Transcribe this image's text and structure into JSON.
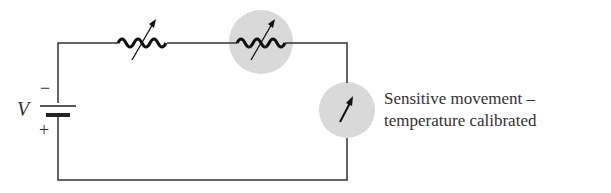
{
  "diagram": {
    "battery": {
      "label": "V",
      "negative": "−",
      "positive": "+"
    },
    "components": [
      {
        "type": "variable-resistor",
        "highlighted": false
      },
      {
        "type": "variable-resistor",
        "highlighted": true
      },
      {
        "type": "meter",
        "highlighted": true
      }
    ],
    "caption": {
      "line1": "Sensitive movement –",
      "line2": "temperature calibrated"
    },
    "colors": {
      "wire": "#333333",
      "highlight": "#d9d9d9"
    }
  }
}
